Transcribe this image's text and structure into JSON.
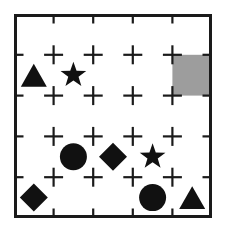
{
  "puzzle": {
    "title": "Shape Grid Puzzle",
    "grid": {
      "columns": 5,
      "rows": 5,
      "origin_x": 14,
      "origin_y": 14,
      "cell_width": 39.6,
      "cell_height": 40.8,
      "border_color": "#1a1a1a",
      "border_width": 3,
      "line_color": "#1a1a1a",
      "line_width": 2.2,
      "dash_length": 19,
      "background_color": "#ffffff"
    },
    "highlight": {
      "label": "highlighted-cell",
      "col": 5,
      "row": 2,
      "color": "#9d9d9d"
    },
    "shape_color": "#111111",
    "shapes": [
      {
        "type": "triangle",
        "col": 1,
        "row": 2,
        "size": 26,
        "label": "triangle-r2c1"
      },
      {
        "type": "star",
        "col": 2,
        "row": 2,
        "size": 27,
        "label": "star-r2c2"
      },
      {
        "type": "circle",
        "col": 2,
        "row": 4,
        "size": 27,
        "label": "circle-r4c2"
      },
      {
        "type": "diamond",
        "col": 3,
        "row": 4,
        "size": 28,
        "label": "diamond-r4c3"
      },
      {
        "type": "star",
        "col": 4,
        "row": 4,
        "size": 27,
        "label": "star-r4c4"
      },
      {
        "type": "diamond",
        "col": 1,
        "row": 5,
        "size": 28,
        "label": "diamond-r5c1"
      },
      {
        "type": "circle",
        "col": 4,
        "row": 5,
        "size": 27,
        "label": "circle-r5c4"
      },
      {
        "type": "triangle",
        "col": 5,
        "row": 5,
        "size": 26,
        "label": "triangle-r5c5"
      }
    ]
  }
}
